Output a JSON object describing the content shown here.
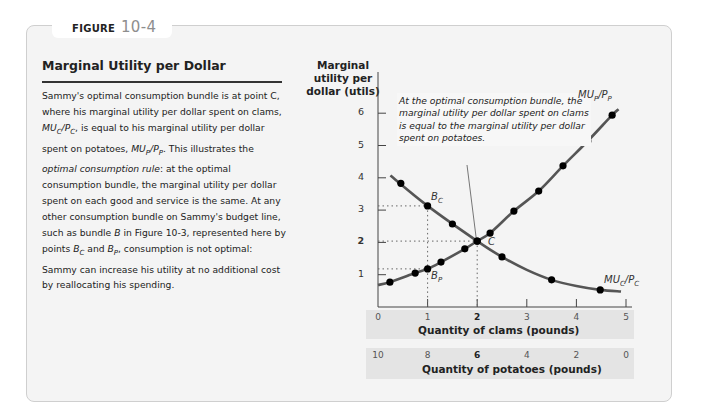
{
  "figure": {
    "label": "FIGURE",
    "number": "10-4",
    "title": "Marginal Utility per Dollar",
    "caption": [
      "Sammy's optimal consumption bundle is at point C, where his marginal utility per dollar spent on clams, ",
      "MU_C/P_C",
      ", is equal to his marginal utility per dollar spent on potatoes, ",
      "MU_P/P_P",
      ". This illustrates the ",
      "optimal consumption rule",
      ": at the optimal consumption bundle, the marginal utility per dollar spent on each good and service is the same. At any other consumption bundle on Sammy's budget line, such as bundle ",
      "B",
      " in Figure 10-3, represented here by points ",
      "B_C",
      " and ",
      "B_P",
      ", consumption is not optimal: Sammy can increase his utility at no additional cost by reallocating his spending."
    ]
  },
  "chart_data": {
    "type": "line",
    "title": "Marginal Utility per Dollar",
    "ylabel": "Marginal utility per dollar (utils)",
    "xlabel": "Quantity of clams (pounds)",
    "x2label": "Quantity of potatoes (pounds)",
    "xlim": [
      0,
      5
    ],
    "ylim": [
      0,
      6.5
    ],
    "x_ticks": [
      "0",
      "1",
      "2",
      "3",
      "4",
      "5"
    ],
    "x2_ticks": [
      "10",
      "8",
      "6",
      "4",
      "2",
      "0"
    ],
    "y_ticks": [
      "1",
      "2",
      "3",
      "4",
      "5",
      "6"
    ],
    "grid": false,
    "series": [
      {
        "name": "MU_C/P_C",
        "points": [
          [
            0.46,
            3.83
          ],
          [
            1.0,
            3.13
          ],
          [
            1.5,
            2.57
          ],
          [
            2.0,
            2.04
          ],
          [
            2.5,
            1.55
          ],
          [
            3.5,
            0.84
          ],
          [
            4.48,
            0.53
          ]
        ],
        "line": [
          [
            0.25,
            4.07
          ],
          [
            1.0,
            3.13
          ],
          [
            2.0,
            2.04
          ],
          [
            2.5,
            1.55
          ],
          [
            3.0,
            1.15
          ],
          [
            3.5,
            0.84
          ],
          [
            4.0,
            0.65
          ],
          [
            4.48,
            0.53
          ],
          [
            4.9,
            0.48
          ]
        ]
      },
      {
        "name": "MU_P/P_P",
        "points": [
          [
            0.24,
            0.77
          ],
          [
            0.75,
            1.05
          ],
          [
            1.0,
            1.18
          ],
          [
            1.27,
            1.39
          ],
          [
            1.75,
            1.8
          ],
          [
            2.0,
            2.04
          ],
          [
            2.26,
            2.29
          ],
          [
            2.74,
            2.97
          ],
          [
            3.24,
            3.59
          ],
          [
            3.73,
            4.37
          ],
          [
            4.23,
            5.14
          ],
          [
            4.72,
            5.94
          ]
        ],
        "line": [
          [
            0.0,
            0.68
          ],
          [
            0.24,
            0.77
          ],
          [
            0.75,
            1.05
          ],
          [
            1.0,
            1.18
          ],
          [
            1.27,
            1.39
          ],
          [
            1.75,
            1.8
          ],
          [
            2.0,
            2.04
          ],
          [
            2.26,
            2.29
          ],
          [
            2.74,
            2.97
          ],
          [
            3.24,
            3.59
          ],
          [
            3.73,
            4.37
          ],
          [
            4.23,
            5.14
          ],
          [
            4.72,
            5.94
          ],
          [
            4.85,
            6.12
          ]
        ]
      }
    ],
    "annotations": [
      {
        "label": "C",
        "x": 2,
        "y": 2.04
      },
      {
        "label": "B_C",
        "x": 1,
        "y": 3.13
      },
      {
        "label": "B_P",
        "x": 1,
        "y": 1.18
      },
      {
        "text": "At the optimal consumption bundle, the marginal utility per dollar spent on clams is equal to the marginal utility per dollar spent on potatoes.",
        "points_to": "C"
      }
    ]
  },
  "labels": {
    "ylabel_lines": [
      "Marginal",
      "utility per",
      "dollar (utils)"
    ],
    "callout": "At the optimal consumption bundle, the marginal utility per dollar spent on clams is equal to the marginal utility per dollar spent on potatoes.",
    "point_c": "C",
    "point_bc": "B",
    "point_bc_sub": "C",
    "point_bp": "B",
    "point_bp_sub": "P",
    "curve_mup": "MU",
    "curve_mup_sub": "P",
    "curve_mup_den": "/P",
    "curve_mup_den_sub": "P",
    "curve_muc": "MU",
    "curve_muc_sub": "C",
    "curve_muc_den": "/P",
    "curve_muc_den_sub": "C",
    "clams_axis": "Quantity of clams (pounds)",
    "potatoes_axis": "Quantity of potatoes (pounds)"
  },
  "colors": {
    "panel_bg": "#f4f4f4",
    "curve": "#555555",
    "dot": "#000000",
    "strip_bg": "#e4e4e4"
  }
}
